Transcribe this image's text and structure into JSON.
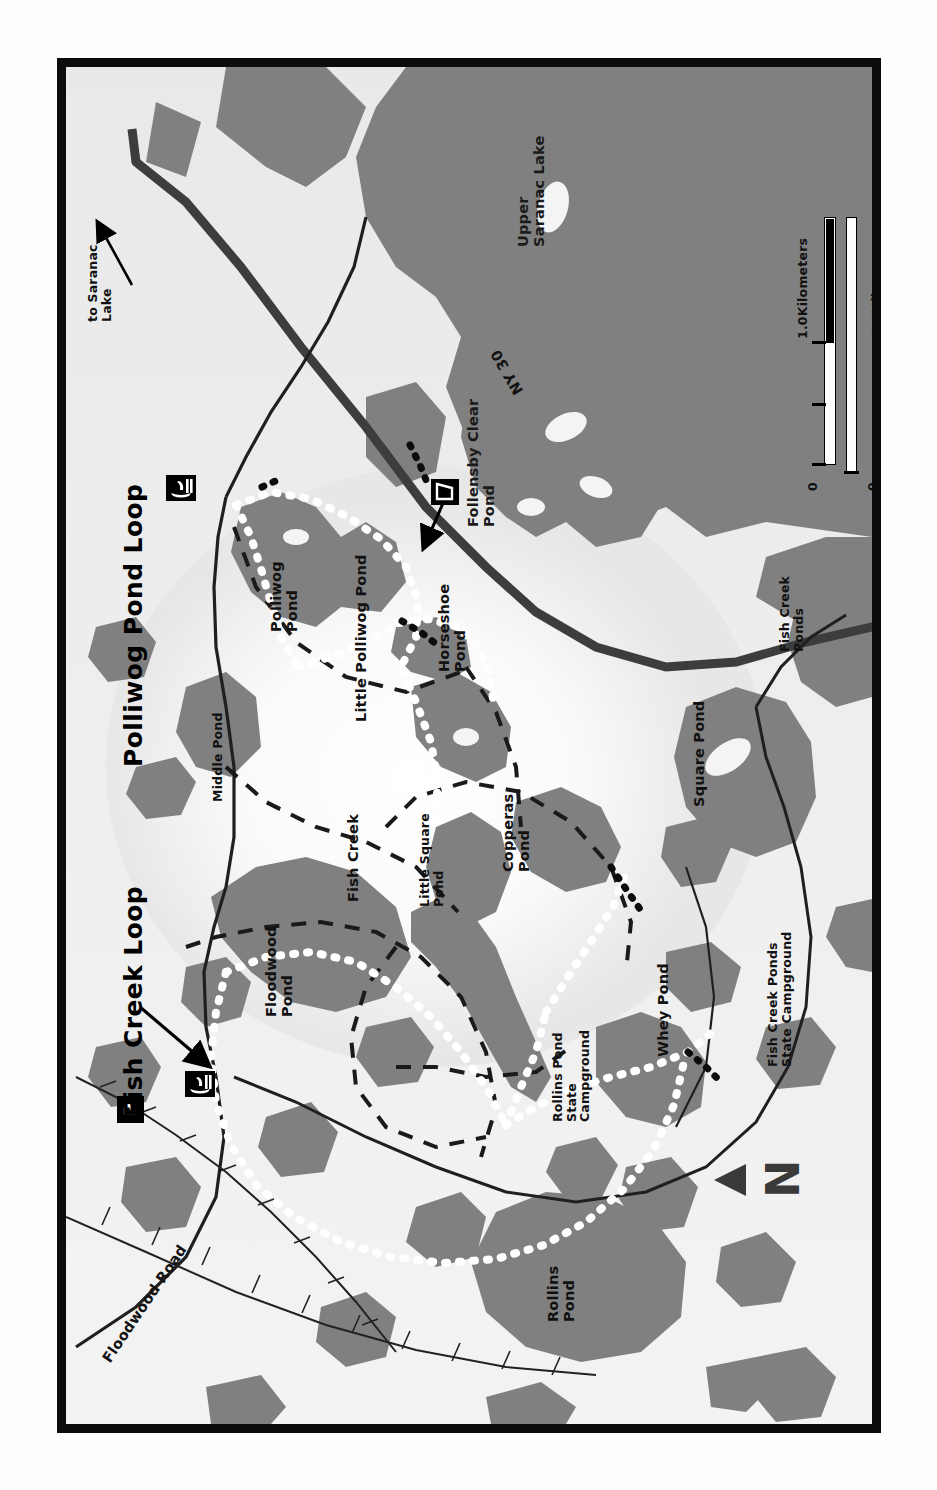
{
  "map": {
    "titles": [
      {
        "text": "Fish Creek Loop",
        "name": "title-fish-creek-loop"
      },
      {
        "text": "Polliwog Pond Loop",
        "name": "title-polliwog-pond-loop"
      }
    ],
    "orientation_note": "north-arrow",
    "north_label": "N",
    "water_labels": [
      "Upper Saranac Lake",
      "Follensby Clear Pond",
      "Polliwog Pond",
      "Little Polliwog Pond",
      "Horseshoe Pond",
      "Middle Pond",
      "Floodwood Pond",
      "Fish Creek",
      "Little Square Pond",
      "Copperas Pond",
      "Square Pond",
      "Fish Creek Ponds",
      "Whey Pond",
      "Rollins Pond"
    ],
    "place_labels": [
      "Rollins Pond State Campground",
      "Fish Creek Ponds State Campground"
    ],
    "road_labels": [
      "NY 30",
      "Floodwood Road"
    ],
    "direction_labels": [
      "to Saranac Lake"
    ],
    "markers": [
      {
        "icon": "boat-launch-icon",
        "label": "boat launch"
      },
      {
        "icon": "boat-launch-icon",
        "label": "boat launch"
      },
      {
        "icon": "parking-icon",
        "label": "P"
      },
      {
        "icon": "lean-to-icon",
        "label": "lean-to"
      }
    ],
    "parking_letter": "P",
    "scale": {
      "km_label": "1.0Kilometers",
      "miles_label": "1.0Miles",
      "zero_top": "0",
      "zero_bottom": "0"
    },
    "colors": {
      "water": "#808080",
      "land": "#f1f1f1",
      "frame": "#0c0c0c",
      "road": "#4a4a4a",
      "trail_dot": "#ffffff",
      "text": "#111111"
    }
  }
}
